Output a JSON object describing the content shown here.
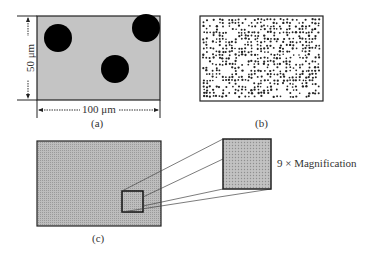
{
  "figure": {
    "panel_a": {
      "label": "(a)",
      "width_dimension": "100 μm",
      "height_dimension": "50 μm",
      "matrix_color": "#c4c4c4",
      "particle_color": "#000000",
      "particle_count": 3
    },
    "panel_b": {
      "label": "(b)",
      "description": "Many fine dispersed particles"
    },
    "panel_c": {
      "label": "(c)",
      "magnification_label": "9 × Magnification"
    }
  }
}
